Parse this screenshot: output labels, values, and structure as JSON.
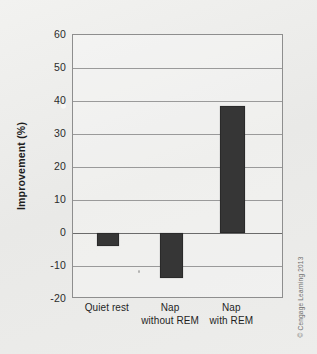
{
  "chart_data": {
    "type": "bar",
    "title": "",
    "xlabel": "",
    "ylabel": "Improvement (%)",
    "categories": [
      "Quiet rest",
      "Nap without REM",
      "Nap with REM"
    ],
    "category_lines": [
      [
        "Quiet rest",
        ""
      ],
      [
        "Nap",
        "without REM"
      ],
      [
        "Nap",
        "with REM"
      ]
    ],
    "values": [
      -4,
      -13.5,
      38.5
    ],
    "ylim": [
      -20,
      60
    ],
    "yticks": [
      60,
      50,
      40,
      30,
      20,
      10,
      0,
      -10,
      -20
    ],
    "ytick_labels": [
      "60",
      "50",
      "40",
      "30",
      "20",
      "10",
      "0",
      "-10",
      "-20"
    ],
    "grid": true,
    "legend": "none",
    "bar_color": "#363636",
    "axis_color": "#8e8e8e",
    "gridline_color": "#9a9a9a"
  },
  "credit": {
    "text": "© Cengage Learning 2013"
  }
}
